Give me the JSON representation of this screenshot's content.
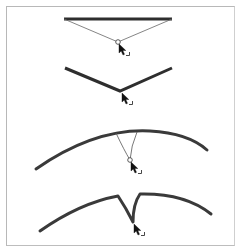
{
  "figure": {
    "colors": {
      "stroke": "#3a3a3a",
      "guide": "#555555",
      "frame": "#b8b8b8"
    },
    "steps": [
      {
        "id": "step-1",
        "name": "straight-segment-drag-start"
      },
      {
        "id": "step-2",
        "name": "corner-point-result"
      },
      {
        "id": "step-3",
        "name": "curved-segment-drag-start"
      },
      {
        "id": "step-4",
        "name": "cusp-point-result"
      }
    ],
    "icons": {
      "cursor": "arrow-cursor-with-corner-icon"
    }
  }
}
